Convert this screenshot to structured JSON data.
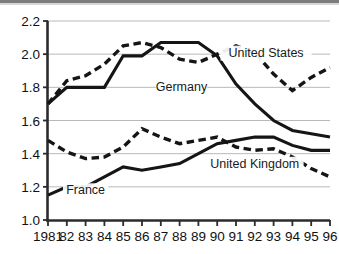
{
  "chart_data": {
    "type": "line",
    "title": "",
    "subtitle": "",
    "xlabel": "",
    "ylabel": "",
    "xlim": [
      1981,
      1996
    ],
    "ylim": [
      1.0,
      2.2
    ],
    "grid": "horizontal",
    "legend_position": "inline-annotations",
    "x": [
      1981,
      1982,
      1983,
      1984,
      1985,
      1986,
      1987,
      1988,
      1989,
      1990,
      1991,
      1992,
      1993,
      1994,
      1995,
      1996
    ],
    "xtick_labels": [
      "1981",
      "82",
      "83",
      "84",
      "85",
      "86",
      "87",
      "88",
      "89",
      "90",
      "91",
      "92",
      "93",
      "94",
      "95",
      "96"
    ],
    "ytick_labels": [
      "1.0",
      "1.2",
      "1.4",
      "1.6",
      "1.8",
      "2.0",
      "2.2"
    ],
    "ytick_values": [
      1.0,
      1.2,
      1.4,
      1.6,
      1.8,
      2.0,
      2.2
    ],
    "series": [
      {
        "name": "United States",
        "style": "dashed",
        "color": "#151515",
        "values": [
          1.7,
          1.84,
          1.87,
          1.94,
          2.05,
          2.07,
          2.04,
          1.97,
          1.95,
          2.0,
          2.05,
          2.01,
          1.88,
          1.78,
          1.86,
          1.92
        ]
      },
      {
        "name": "Germany",
        "style": "solid",
        "color": "#151515",
        "values": [
          1.7,
          1.8,
          1.8,
          1.8,
          1.99,
          1.99,
          2.07,
          2.07,
          2.07,
          1.99,
          1.82,
          1.7,
          1.6,
          1.54,
          1.52,
          1.5
        ]
      },
      {
        "name": "United Kingdom",
        "style": "dashed",
        "color": "#151515",
        "values": [
          1.48,
          1.41,
          1.37,
          1.38,
          1.44,
          1.55,
          1.5,
          1.46,
          1.48,
          1.5,
          1.44,
          1.42,
          1.43,
          1.38,
          1.31,
          1.26
        ]
      },
      {
        "name": "France",
        "style": "solid",
        "color": "#151515",
        "values": [
          1.15,
          1.2,
          1.2,
          1.26,
          1.32,
          1.3,
          1.32,
          1.34,
          1.4,
          1.46,
          1.48,
          1.5,
          1.5,
          1.45,
          1.42,
          1.42
        ]
      }
    ],
    "annotations": [
      {
        "text": "United States",
        "x": 1992.6,
        "y": 1.985
      },
      {
        "text": "Germany",
        "x": 1988.1,
        "y": 1.775
      },
      {
        "text": "United Kingdom",
        "x": 1992.0,
        "y": 1.315
      },
      {
        "text": "France",
        "x": 1983.0,
        "y": 1.155
      }
    ]
  }
}
